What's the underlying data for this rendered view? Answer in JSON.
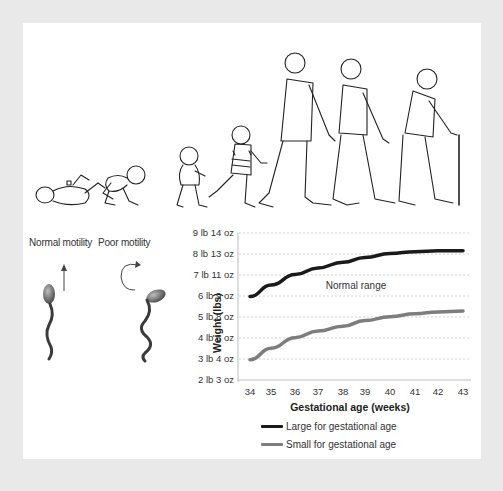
{
  "illustration": {
    "description": "Human life stages from newborn to elderly",
    "stages": [
      "newborn-lying",
      "crawling-baby",
      "toddler",
      "child",
      "young-adult",
      "middle-aged-adult",
      "elderly-with-cane"
    ]
  },
  "motility": {
    "normal_label": "Normal motility",
    "poor_label": "Poor motility"
  },
  "chart_data": {
    "type": "line",
    "title": "",
    "xlabel": "Gestational age (weeks)",
    "ylabel": "Weight (lbs)",
    "x": [
      34,
      35,
      36,
      37,
      38,
      39,
      40,
      41,
      42,
      43
    ],
    "y_tick_labels": [
      "2 lb 3 oz",
      "3 lb 4 oz",
      "4 lb 6 oz",
      "5 lb 8 oz",
      "6 lb 9 oz",
      "7 lb 11 oz",
      "8 lb 13 oz",
      "9 lb 14 oz"
    ],
    "ylim": [
      2.1875,
      9.875
    ],
    "grid": true,
    "annotation": "Normal range",
    "series": [
      {
        "name": "Large for gestational age",
        "color": "#1a1a1a",
        "values": [
          6.55,
          7.15,
          7.7,
          8.05,
          8.35,
          8.6,
          8.8,
          8.9,
          8.95,
          8.95
        ]
      },
      {
        "name": "Small for gestational age",
        "color": "#7d7d7d",
        "values": [
          3.25,
          3.85,
          4.4,
          4.75,
          5.0,
          5.3,
          5.5,
          5.65,
          5.75,
          5.8
        ]
      }
    ],
    "legend_position": "bottom"
  },
  "colors": {
    "border": "#e9e9e9",
    "panel": "#ffffff",
    "large_line": "#1a1a1a",
    "small_line": "#7d7d7d",
    "grid": "#c8c8c8"
  }
}
